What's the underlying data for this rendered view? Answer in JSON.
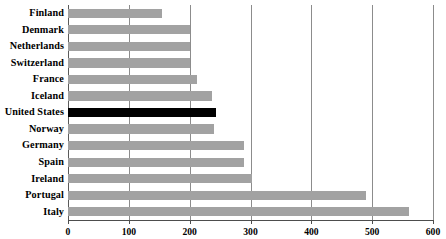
{
  "chart_data": {
    "type": "bar",
    "orientation": "horizontal",
    "title": "",
    "subtitle": "",
    "xlabel": "",
    "ylabel": "",
    "xlim": [
      0,
      600
    ],
    "ylim": null,
    "grid": true,
    "legend": null,
    "xticks": [
      0,
      100,
      200,
      300,
      400,
      500,
      600
    ],
    "xtick_labels": [
      "0",
      "100",
      "200",
      "300",
      "400",
      "500",
      "600"
    ],
    "categories": [
      "Finland",
      "Denmark",
      "Netherlands",
      "Switzerland",
      "France",
      "Iceland",
      "United States",
      "Norway",
      "Germany",
      "Spain",
      "Ireland",
      "Portugal",
      "Italy"
    ],
    "values": [
      155,
      200,
      200,
      200,
      212,
      237,
      243,
      240,
      290,
      290,
      303,
      490,
      560
    ],
    "highlight_category": "United States",
    "colors": {
      "bar": "#a2a2a2",
      "highlight_bar": "#000000",
      "gridline": "#8c8c8c",
      "axis": "#4d4d4d",
      "background": "#ffffff",
      "text": "#000000"
    },
    "annotations": []
  }
}
